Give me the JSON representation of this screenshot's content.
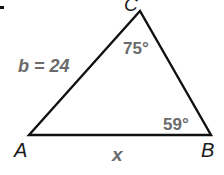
{
  "diagram": {
    "type": "triangle",
    "vertices": {
      "A": {
        "label": "A",
        "x": 29,
        "y": 135
      },
      "B": {
        "label": "B",
        "x": 211,
        "y": 135
      },
      "C": {
        "label": "C",
        "x": 140,
        "y": 11
      }
    },
    "side_labels": {
      "b": "b = 24",
      "x": "x"
    },
    "angle_labels": {
      "C": "75°",
      "B": "59°"
    },
    "colors": {
      "stroke": "#111111",
      "label_gray": "#6b6b6b"
    }
  }
}
